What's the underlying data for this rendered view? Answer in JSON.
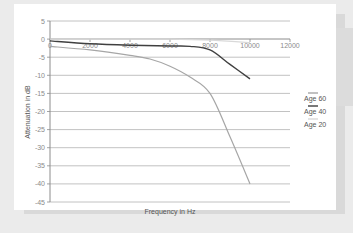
{
  "chart_data": {
    "type": "line",
    "title": "",
    "xlabel": "Frequency in Hz",
    "ylabel": "Attenuation in dB",
    "xlim": [
      0,
      12000
    ],
    "ylim": [
      -45,
      5
    ],
    "x_ticks": [
      "0",
      "2000",
      "4000",
      "6000",
      "8000",
      "10000",
      "12000"
    ],
    "y_ticks": [
      "5",
      "0",
      "-5",
      "-10",
      "-15",
      "-20",
      "-25",
      "-30",
      "-35",
      "-40",
      "-45"
    ],
    "grid": true,
    "legend_position": "right",
    "series": [
      {
        "name": "Age 60",
        "color": "#a6a6a6",
        "x": [
          0,
          2000,
          4000,
          5000,
          6000,
          7000,
          8000,
          9000,
          10000
        ],
        "values": [
          -2,
          -3,
          -4.5,
          -5.5,
          -7.5,
          -10.5,
          -15,
          -27,
          -40
        ]
      },
      {
        "name": "Age 40",
        "color": "#404040",
        "x": [
          0,
          2000,
          4000,
          6000,
          7000,
          8000,
          9000,
          10000
        ],
        "values": [
          -0.5,
          -1.3,
          -1.7,
          -1.9,
          -2,
          -3,
          -7,
          -11
        ]
      },
      {
        "name": "Age 20",
        "color": "#d9d9d9",
        "x": [
          0,
          2000,
          4000,
          6000,
          8000,
          10000
        ],
        "values": [
          0,
          0,
          0,
          0,
          -0.3,
          -1
        ]
      }
    ]
  },
  "axis": {
    "xlabel": "Frequency in Hz",
    "ylabel": "Attenuation in dB",
    "x_ticks": [
      "0",
      "2000",
      "4000",
      "6000",
      "8000",
      "10000",
      "12000"
    ],
    "y_ticks": [
      "5",
      "0",
      "-5",
      "-10",
      "-15",
      "-20",
      "-25",
      "-30",
      "-35",
      "-40",
      "-45"
    ]
  },
  "legend": [
    {
      "label": "Age 60",
      "color": "#a6a6a6"
    },
    {
      "label": "Age 40",
      "color": "#404040"
    },
    {
      "label": "Age 20",
      "color": "#d9d9d9"
    }
  ]
}
